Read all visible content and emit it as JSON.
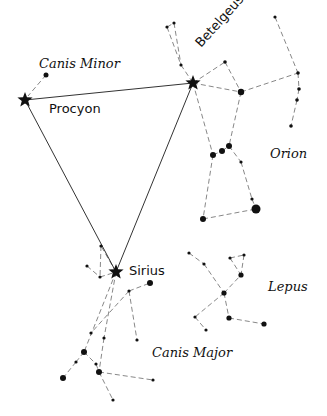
{
  "colors": {
    "background": "#ffffff",
    "ink": "#111111",
    "dashed": "#888888",
    "triangle": "#333333"
  },
  "labels": {
    "canis_minor": "Canis Minor",
    "orion": "Orion",
    "lepus": "Lepus",
    "canis_major": "Canis Major",
    "procyon": "Procyon",
    "betelgeuse": "Betelgeuse",
    "sirius": "Sirius"
  },
  "bright_stars": [
    {
      "name": "Procyon",
      "x": 25,
      "y": 100
    },
    {
      "name": "Betelgeuse",
      "x": 193,
      "y": 83
    },
    {
      "name": "Sirius",
      "x": 116,
      "y": 272
    }
  ],
  "triangle": [
    [
      25,
      100
    ],
    [
      193,
      83
    ],
    [
      116,
      272
    ]
  ],
  "stars": [
    {
      "c": "canis_minor",
      "x": 46,
      "y": 75,
      "r": 2.5
    },
    {
      "c": "orion",
      "x": 167,
      "y": 27,
      "r": 1.6
    },
    {
      "c": "orion",
      "x": 174,
      "y": 23,
      "r": 1.6
    },
    {
      "c": "orion",
      "x": 181,
      "y": 65,
      "r": 1.6
    },
    {
      "c": "orion",
      "x": 225,
      "y": 62,
      "r": 1.8
    },
    {
      "c": "orion",
      "x": 241,
      "y": 92,
      "r": 3.2
    },
    {
      "c": "orion",
      "x": 275,
      "y": 17,
      "r": 1.6
    },
    {
      "c": "orion",
      "x": 298,
      "y": 73,
      "r": 1.8
    },
    {
      "c": "orion",
      "x": 299,
      "y": 89,
      "r": 1.8
    },
    {
      "c": "orion",
      "x": 297,
      "y": 100,
      "r": 1.8
    },
    {
      "c": "orion",
      "x": 291,
      "y": 126,
      "r": 1.8
    },
    {
      "c": "orion",
      "x": 213,
      "y": 155,
      "r": 3
    },
    {
      "c": "orion",
      "x": 222,
      "y": 151,
      "r": 3
    },
    {
      "c": "orion",
      "x": 229,
      "y": 146,
      "r": 3
    },
    {
      "c": "orion",
      "x": 241,
      "y": 162,
      "r": 1.6
    },
    {
      "c": "orion",
      "x": 252,
      "y": 199,
      "r": 1.6
    },
    {
      "c": "orion",
      "x": 256,
      "y": 209,
      "r": 4.5
    },
    {
      "c": "orion",
      "x": 203,
      "y": 219,
      "r": 3
    },
    {
      "c": "lepus",
      "x": 189,
      "y": 253,
      "r": 1.6
    },
    {
      "c": "lepus",
      "x": 204,
      "y": 264,
      "r": 1.6
    },
    {
      "c": "lepus",
      "x": 224,
      "y": 293,
      "r": 2.6
    },
    {
      "c": "lepus",
      "x": 230,
      "y": 258,
      "r": 1.6
    },
    {
      "c": "lepus",
      "x": 244,
      "y": 255,
      "r": 1.6
    },
    {
      "c": "lepus",
      "x": 241,
      "y": 275,
      "r": 2.6
    },
    {
      "c": "lepus",
      "x": 252,
      "y": 283,
      "r": 0
    },
    {
      "c": "lepus",
      "x": 229,
      "y": 318,
      "r": 2.6
    },
    {
      "c": "lepus",
      "x": 195,
      "y": 317,
      "r": 1.6
    },
    {
      "c": "lepus",
      "x": 206,
      "y": 330,
      "r": 1.6
    },
    {
      "c": "lepus",
      "x": 264,
      "y": 324,
      "r": 2.6
    },
    {
      "c": "canis_major",
      "x": 101,
      "y": 246,
      "r": 1.6
    },
    {
      "c": "canis_major",
      "x": 87,
      "y": 266,
      "r": 1.6
    },
    {
      "c": "canis_major",
      "x": 100,
      "y": 277,
      "r": 1.6
    },
    {
      "c": "canis_major",
      "x": 150,
      "y": 283,
      "r": 3
    },
    {
      "c": "canis_major",
      "x": 129,
      "y": 291,
      "r": 1.6
    },
    {
      "c": "canis_major",
      "x": 137,
      "y": 340,
      "r": 1.6
    },
    {
      "c": "canis_major",
      "x": 91,
      "y": 333,
      "r": 1.6
    },
    {
      "c": "canis_major",
      "x": 104,
      "y": 338,
      "r": 1.6
    },
    {
      "c": "canis_major",
      "x": 84,
      "y": 352,
      "r": 3
    },
    {
      "c": "canis_major",
      "x": 76,
      "y": 362,
      "r": 1.6
    },
    {
      "c": "canis_major",
      "x": 96,
      "y": 364,
      "r": 1.6
    },
    {
      "c": "canis_major",
      "x": 99,
      "y": 372,
      "r": 3
    },
    {
      "c": "canis_major",
      "x": 63,
      "y": 378,
      "r": 3
    },
    {
      "c": "canis_major",
      "x": 153,
      "y": 380,
      "r": 1.6
    },
    {
      "c": "canis_major",
      "x": 113,
      "y": 400,
      "r": 1.6
    }
  ],
  "lines": [
    [
      46,
      75,
      28,
      96
    ],
    [
      167,
      27,
      174,
      23
    ],
    [
      167,
      27,
      181,
      65
    ],
    [
      174,
      23,
      181,
      65
    ],
    [
      181,
      65,
      193,
      83
    ],
    [
      193,
      83,
      225,
      62
    ],
    [
      225,
      62,
      241,
      92
    ],
    [
      193,
      83,
      241,
      92
    ],
    [
      241,
      92,
      298,
      73
    ],
    [
      275,
      17,
      298,
      73
    ],
    [
      298,
      73,
      299,
      89
    ],
    [
      299,
      89,
      297,
      100
    ],
    [
      297,
      100,
      291,
      126
    ],
    [
      193,
      83,
      213,
      155
    ],
    [
      241,
      92,
      229,
      146
    ],
    [
      213,
      155,
      222,
      151
    ],
    [
      222,
      151,
      229,
      146
    ],
    [
      229,
      146,
      241,
      162
    ],
    [
      241,
      162,
      252,
      199
    ],
    [
      252,
      199,
      256,
      209
    ],
    [
      213,
      155,
      203,
      219
    ],
    [
      203,
      219,
      256,
      209
    ],
    [
      189,
      253,
      204,
      264
    ],
    [
      204,
      264,
      224,
      293
    ],
    [
      230,
      258,
      244,
      255
    ],
    [
      230,
      258,
      241,
      275
    ],
    [
      244,
      255,
      241,
      275
    ],
    [
      224,
      293,
      241,
      275
    ],
    [
      224,
      293,
      229,
      318
    ],
    [
      229,
      318,
      264,
      324
    ],
    [
      224,
      293,
      195,
      317
    ],
    [
      195,
      317,
      206,
      330
    ],
    [
      116,
      272,
      101,
      246
    ],
    [
      101,
      246,
      100,
      277
    ],
    [
      87,
      266,
      100,
      277
    ],
    [
      100,
      277,
      116,
      272
    ],
    [
      116,
      272,
      84,
      352
    ],
    [
      116,
      272,
      104,
      338
    ],
    [
      129,
      291,
      150,
      283
    ],
    [
      129,
      291,
      137,
      340
    ],
    [
      129,
      291,
      91,
      333
    ],
    [
      84,
      352,
      76,
      362
    ],
    [
      76,
      362,
      63,
      378
    ],
    [
      84,
      352,
      96,
      364
    ],
    [
      96,
      364,
      99,
      372
    ],
    [
      104,
      338,
      99,
      372
    ],
    [
      99,
      372,
      153,
      380
    ],
    [
      99,
      372,
      113,
      400
    ]
  ]
}
